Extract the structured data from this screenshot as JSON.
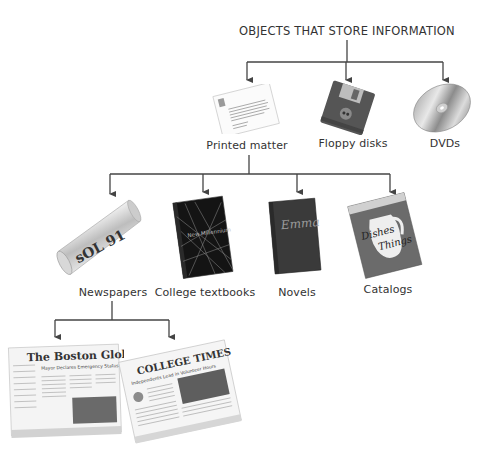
{
  "title": "OBJECTS THAT STORE INFORMATION",
  "level1": [
    {
      "label": "Printed matter",
      "icon": "printed-letter-icon"
    },
    {
      "label": "Floppy disks",
      "icon": "floppy-disk-icon"
    },
    {
      "label": "DVDs",
      "icon": "dvd-disc-icon"
    }
  ],
  "level2": [
    {
      "label": "Newspapers",
      "icon": "rolled-newspaper-icon"
    },
    {
      "label": "College textbooks",
      "icon": "textbook-icon"
    },
    {
      "label": "Novels",
      "icon": "novel-book-icon"
    },
    {
      "label": "Catalogs",
      "icon": "catalog-magazine-icon"
    }
  ],
  "level3": [
    {
      "masthead": "The Boston Globe",
      "headline": "Mayor Declares Emergency Status",
      "icon": "boston-globe-newspaper-icon"
    },
    {
      "masthead": "COLLEGE TIMES",
      "headline": "Independents Lead in Volunteer Hours",
      "icon": "college-times-newspaper-icon"
    }
  ],
  "covers": {
    "textbook_title": "New Millennium",
    "novel_title": "Emma",
    "catalog_title_1": "Dishes",
    "catalog_title_2": "Things"
  },
  "colors": {
    "line": "#444444",
    "text": "#333333"
  }
}
